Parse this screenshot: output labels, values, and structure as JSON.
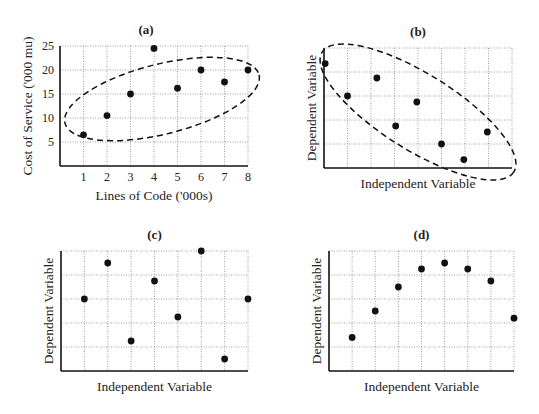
{
  "figure": {
    "background": "#ffffff",
    "ink": "#111111",
    "grid_color": "#888888"
  },
  "chart_data": [
    {
      "id": "a",
      "type": "scatter",
      "title": "(a)",
      "xlabel": "Lines of Code ('000s)",
      "ylabel": "Cost of Service ('000 mu)",
      "x_ticks": [
        "1",
        "2",
        "3",
        "4",
        "5",
        "6",
        "7",
        "8"
      ],
      "y_ticks": [
        "5",
        "10",
        "15",
        "20",
        "25"
      ],
      "xlim": [
        0,
        8
      ],
      "ylim": [
        0,
        25
      ],
      "grid": true,
      "x": [
        1,
        2,
        3,
        4,
        5,
        6,
        7,
        8
      ],
      "y": [
        6.5,
        10.5,
        15,
        24.5,
        16.2,
        20,
        17.5,
        20
      ],
      "annotation": "dashed ellipse enclosing points (positive correlation)",
      "frame": {
        "left": 60,
        "top": 46,
        "right": 248,
        "bottom": 166
      },
      "ellipse": {
        "cx": 162,
        "cy": 99,
        "rx": 100,
        "ry": 35,
        "rot": -14
      }
    },
    {
      "id": "b",
      "type": "scatter",
      "title": "(b)",
      "xlabel": "Independent Variable",
      "ylabel": "Dependent Variable",
      "x_ticks": [],
      "y_ticks": [],
      "xlim": [
        0,
        8
      ],
      "ylim": [
        0,
        5
      ],
      "grid": true,
      "x": [
        0.05,
        1.0,
        2.25,
        3.05,
        3.95,
        5.0,
        5.95,
        6.95
      ],
      "y": [
        4.35,
        3.0,
        3.75,
        1.75,
        2.75,
        1.0,
        0.35,
        1.5
      ],
      "annotation": "dashed ellipse enclosing points (negative correlation)",
      "frame": {
        "left": 324,
        "top": 48,
        "right": 512,
        "bottom": 168
      },
      "ellipse": {
        "cx": 418,
        "cy": 112,
        "rx": 113,
        "ry": 38,
        "rot": 32
      }
    },
    {
      "id": "c",
      "type": "scatter",
      "title": "(c)",
      "xlabel": "Independent Variable",
      "ylabel": "Dependent Variable",
      "x_ticks": [],
      "y_ticks": [],
      "xlim": [
        0,
        8
      ],
      "ylim": [
        0,
        5
      ],
      "grid": true,
      "x": [
        1,
        2,
        3,
        4,
        5,
        6,
        7,
        8
      ],
      "y": [
        3.0,
        4.5,
        1.25,
        3.75,
        2.25,
        5.0,
        0.5,
        3.0
      ],
      "annotation": "no correlation",
      "frame": {
        "left": 61,
        "top": 251,
        "right": 248,
        "bottom": 371
      }
    },
    {
      "id": "d",
      "type": "scatter",
      "title": "(d)",
      "xlabel": "Independent Variable",
      "ylabel": "Dependent Variable",
      "x_ticks": [],
      "y_ticks": [],
      "xlim": [
        0,
        8
      ],
      "ylim": [
        0,
        5
      ],
      "grid": true,
      "x": [
        1,
        2,
        3,
        4,
        5,
        6,
        7,
        8
      ],
      "y": [
        1.4,
        2.5,
        3.5,
        4.25,
        4.5,
        4.25,
        3.75,
        2.2
      ],
      "annotation": "curvilinear (non-linear) relationship",
      "frame": {
        "left": 329,
        "top": 251,
        "right": 514,
        "bottom": 371
      }
    }
  ]
}
